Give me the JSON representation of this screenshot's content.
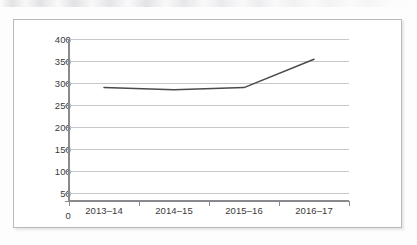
{
  "chart_data": {
    "type": "line",
    "title": "",
    "subtitle": "",
    "xlabel": "",
    "ylabel": "",
    "categories": [
      "2013–14",
      "2014–15",
      "2015–16",
      "2016–17"
    ],
    "series": [
      {
        "name": "",
        "values": [
          280,
          275,
          280,
          350
        ]
      }
    ],
    "ylim": [
      0,
      400
    ],
    "ytick_step": 50,
    "yticks": [
      "400",
      "350",
      "300",
      "250",
      "200",
      "150",
      "100",
      "50",
      "0"
    ],
    "grid": "horizontal",
    "legend": "none",
    "line_color": "#4a4a4a",
    "gridline_color": "#c8c8cc",
    "axis_color": "#8a8a8e",
    "frame_color": "#b9b9bb",
    "text_color": "#3a3a3a",
    "markers": "none"
  }
}
